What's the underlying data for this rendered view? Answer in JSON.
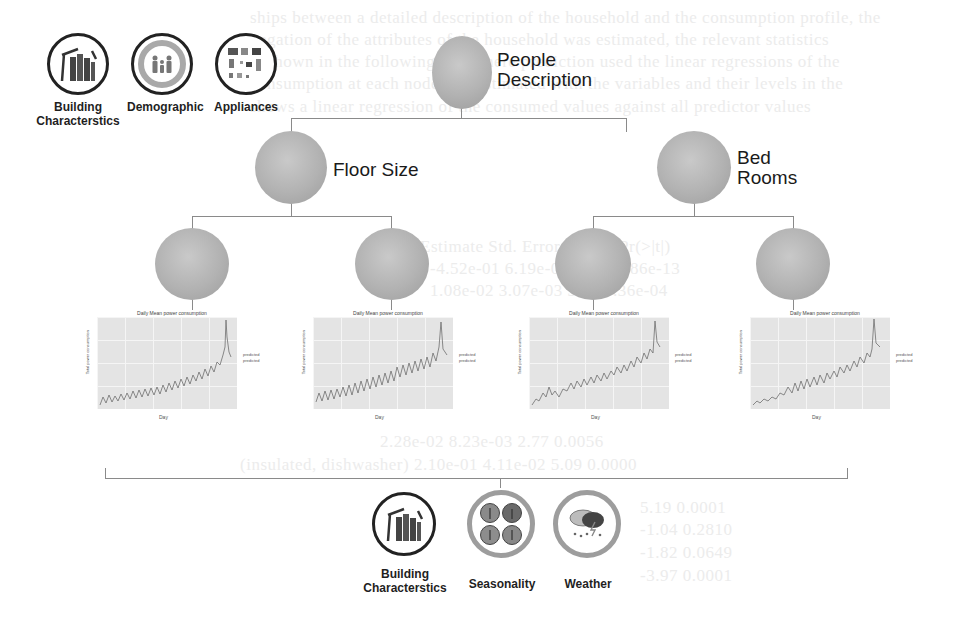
{
  "diagram": {
    "root": {
      "label_line1": "People",
      "label_line2": "Description"
    },
    "level1": [
      {
        "label_line1": "Floor Size",
        "label_line2": ""
      },
      {
        "label_line1": "Bed",
        "label_line2": "Rooms"
      }
    ],
    "level2_count": 4,
    "top_icons": [
      {
        "icon": "building-icon",
        "label_line1": "Building",
        "label_line2": "Characterstics"
      },
      {
        "icon": "family-icon",
        "label_line1": "Demographic",
        "label_line2": ""
      },
      {
        "icon": "appliances-icon",
        "label_line1": "Appliances",
        "label_line2": ""
      }
    ],
    "bottom_icons": [
      {
        "icon": "building-icon",
        "label_line1": "Building",
        "label_line2": "Characterstics"
      },
      {
        "icon": "seasons-icon",
        "label_line1": "Seasonality",
        "label_line2": ""
      },
      {
        "icon": "weather-icon",
        "label_line1": "Weather",
        "label_line2": ""
      }
    ],
    "charts": [
      {
        "title": "Daily Mean power consumption",
        "ylabel": "Total power consumption",
        "xlabel": "Day",
        "legend_title": "predicted",
        "legend_item": "predicted"
      },
      {
        "title": "Daily Mean power consumption",
        "ylabel": "Total power consumption",
        "xlabel": "Day",
        "legend_title": "predicted",
        "legend_item": "predicted"
      },
      {
        "title": "Daily Mean power consumption",
        "ylabel": "Total power consumption",
        "xlabel": "Day",
        "legend_title": "predicted",
        "legend_item": "predicted"
      },
      {
        "title": "Daily Mean power consumption",
        "ylabel": "Total power consumption",
        "xlabel": "Day",
        "legend_title": "predicted",
        "legend_item": "predicted"
      }
    ]
  },
  "colors": {
    "node_fill": "#b2b2b2",
    "connector": "#8a8a8a",
    "plot_bg": "#e4e4e4",
    "series": "#6e6e6e"
  }
}
